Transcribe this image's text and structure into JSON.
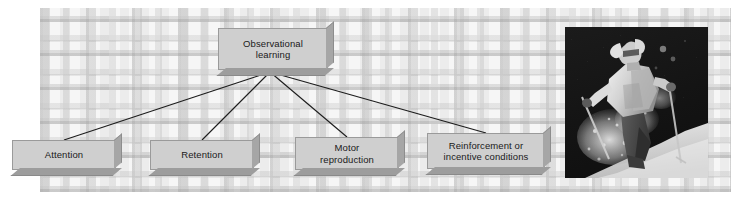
{
  "figure": {
    "background_color": "#f2f2f2",
    "node_fill_color": "#cfcfcf",
    "node_border_color": "#9a9a9a",
    "connector_color": "#1c1c1c"
  },
  "diagram": {
    "root": {
      "label": "Observational\nlearning"
    },
    "steps": [
      {
        "label": "Attention"
      },
      {
        "label": "Retention"
      },
      {
        "label": "Motor\nreproduction"
      },
      {
        "label": "Reinforcement or\nincentive conditions"
      }
    ]
  },
  "photo": {
    "caption": "skier-photograph",
    "description": "Black and white photograph of a skier in a light jacket skiing downhill through snow spray holding ski poles"
  }
}
